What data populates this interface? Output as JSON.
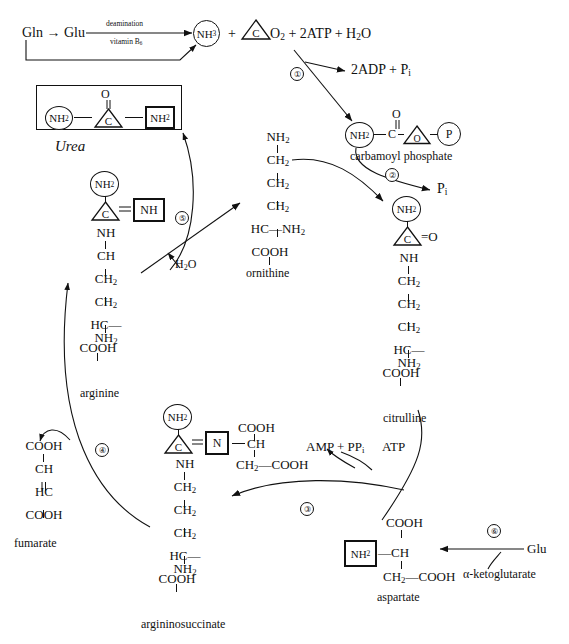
{
  "diagram": {
    "type": "biochemical-pathway"
  },
  "top_reaction": {
    "substrate": "Gln → Glu",
    "arrow_label_above": "deamination",
    "arrow_label_below": "vitamin B6",
    "product_circle": "NH3",
    "plus1": "+",
    "triangle_c": "C",
    "rest": "O2 + 2ATP + H2O"
  },
  "urea_box": {
    "left_circle": "NH2",
    "center_triangle": "C",
    "top_atom": "O",
    "right_square": "NH2",
    "caption": "Urea"
  },
  "steps": {
    "s1": "①",
    "s2": "②",
    "s3": "③",
    "s4": "④",
    "s5": "⑤",
    "s6": "⑥"
  },
  "side_products": {
    "adp": "2ADP + Pi",
    "pi": "Pi",
    "water": "H2O",
    "amp_ppi": "AMP + PPi",
    "atp": "ATP",
    "glu": "Glu",
    "akg": "α-ketoglutarate"
  },
  "carbamoyl_phosphate": {
    "circle": "NH2",
    "carbon": "C",
    "top_atom": "O",
    "triangle_o": "O",
    "circle_p": "P",
    "label": "carbamoyl phosphate"
  },
  "arginine": {
    "circle": "NH2",
    "triangle": "C",
    "square": "NH",
    "chain": [
      "NH",
      "CH",
      "CH2",
      "CH2"
    ],
    "alpha": "HC—NH2",
    "acid": "COOH",
    "label": "arginine"
  },
  "ornithine": {
    "chain": [
      "NH2",
      "CH2",
      "CH2",
      "CH2"
    ],
    "alpha": "HC—NH2",
    "acid": "COOH",
    "label": "ornithine"
  },
  "citrulline": {
    "circle": "NH2",
    "triangle": "C",
    "double_o": "=O",
    "chain": [
      "NH",
      "CH2",
      "CH2",
      "CH2"
    ],
    "alpha": "HC—NH2",
    "acid": "COOH",
    "label": "citrulline"
  },
  "argininosuccinate": {
    "circle": "NH2",
    "triangle": "C",
    "square": "N",
    "branch_top": "COOH",
    "branch_mid": "CH",
    "branch_bottom": "CH2—COOH",
    "chain": [
      "NH",
      "CH2",
      "CH2",
      "CH2"
    ],
    "alpha": "HC—NH2",
    "acid": "COOH",
    "label": "argininosuccinate"
  },
  "fumarate": {
    "rows": [
      "COOH",
      "CH",
      "HC",
      "COOH"
    ],
    "label": "fumarate"
  },
  "aspartate": {
    "square": "NH2",
    "branch_top": "COOH",
    "center": "—CH",
    "branch_bottom": "CH2—COOH",
    "label": "aspartate"
  }
}
